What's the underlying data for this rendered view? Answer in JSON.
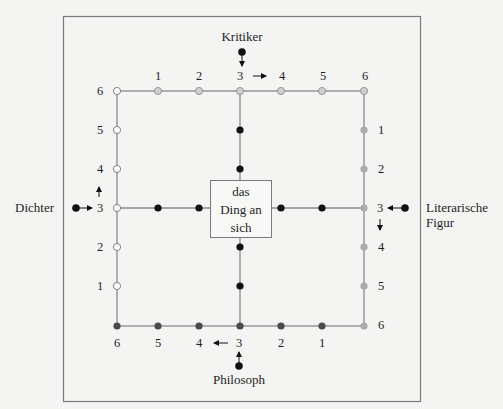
{
  "diagram": {
    "labels": {
      "top": "Kritiker",
      "left": "Dichter",
      "right_line1": "Literarische",
      "right_line2": "Figur",
      "bottom": "Philosoph"
    },
    "center_box": {
      "line1": "das",
      "line2": "Ding an",
      "line3": "sich"
    },
    "top_numbers": [
      "1",
      "2",
      "3",
      "4",
      "5",
      "6"
    ],
    "left_numbers": [
      "6",
      "5",
      "4",
      "3",
      "2",
      "1"
    ],
    "right_numbers": [
      "1",
      "2",
      "3",
      "4",
      "5",
      "6"
    ],
    "bottom_numbers": [
      "6",
      "5",
      "4",
      "3",
      "2",
      "1"
    ],
    "colors": {
      "frame": "#7a7a7a",
      "line": "#8a8a8a",
      "dot_black": "#111111",
      "dot_dark_gray": "#4a4a4a",
      "dot_light_gray": "#c8c8c8",
      "dot_mid_gray": "#a8a8a8",
      "dot_white": "#ffffff",
      "background": "#f4f4f2"
    }
  }
}
